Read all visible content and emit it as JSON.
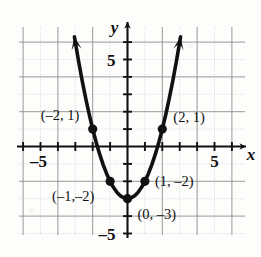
{
  "chart_data": {
    "type": "line",
    "title": "",
    "subtitle": "",
    "xlabel": "x",
    "ylabel": "y",
    "xlim": [
      -6.8,
      7.2
    ],
    "ylim": [
      -6.0,
      7.4
    ],
    "grid": true,
    "grid_major_step": 2,
    "grid_minor_step": 1,
    "legend": "none",
    "x_tick_labels": [
      {
        "value": -5,
        "text": "–5"
      },
      {
        "value": 5,
        "text": "5"
      }
    ],
    "y_tick_labels": [
      {
        "value": 5,
        "text": "5"
      },
      {
        "value": -5,
        "text": "–5"
      }
    ],
    "equation": "y = x² – 3",
    "series": [
      {
        "name": "parabola",
        "color": "#111111",
        "x": [
          -3.05,
          -2.8,
          -2.6,
          -2.4,
          -2.2,
          -2.0,
          -1.8,
          -1.6,
          -1.4,
          -1.2,
          -1.0,
          -0.8,
          -0.6,
          -0.4,
          -0.2,
          0.0,
          0.2,
          0.4,
          0.6,
          0.8,
          1.0,
          1.2,
          1.4,
          1.6,
          1.8,
          2.0,
          2.2,
          2.4,
          2.6,
          2.8,
          3.05
        ],
        "y": [
          6.3,
          4.84,
          3.76,
          2.76,
          1.84,
          1.0,
          0.24,
          -0.44,
          -1.04,
          -1.56,
          -2.0,
          -2.36,
          -2.64,
          -2.84,
          -2.96,
          -3.0,
          -2.96,
          -2.84,
          -2.64,
          -2.36,
          -2.0,
          -1.56,
          -1.04,
          -0.44,
          0.24,
          1.0,
          1.84,
          2.76,
          3.76,
          4.84,
          6.3
        ]
      }
    ],
    "points": [
      {
        "x": -2,
        "y": 1,
        "label": "(–2, 1)",
        "label_pos": "left-above"
      },
      {
        "x": -1,
        "y": -2,
        "label": "(–1,–2)",
        "label_pos": "left-below"
      },
      {
        "x": 0,
        "y": -3,
        "label": "(0, –3)",
        "label_pos": "right-below"
      },
      {
        "x": 1,
        "y": -2,
        "label": "(1, –2)",
        "label_pos": "right"
      },
      {
        "x": 2,
        "y": 1,
        "label": "(2, 1)",
        "label_pos": "right-above"
      }
    ],
    "arrowheads": [
      "start",
      "end"
    ],
    "colors": {
      "curve": "#111111",
      "axis": "#111111",
      "grid_major": "#8d8d8d",
      "grid_minor": "#c9c9c9",
      "point_fill": "#111111",
      "background": "#fdfdfc"
    }
  },
  "figure": {
    "x_axis_label": "x",
    "y_axis_label": "y",
    "x_neg_tick": "–5",
    "x_pos_tick": "5",
    "y_pos_tick": "5",
    "y_neg_tick": "–5",
    "label_a": "(–2, 1)",
    "label_b": "(–1,–2)",
    "label_c": "(0, –3)",
    "label_d": "(1, –2)",
    "label_e": "(2, 1)"
  }
}
